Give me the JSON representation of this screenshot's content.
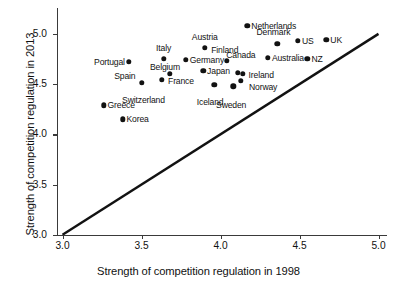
{
  "chart_data": {
    "type": "scatter",
    "title": "",
    "xlabel": "Strength of competition regulation in 1998",
    "ylabel": "Strength of competition regulation in 2013",
    "xlim": [
      3.0,
      5.0
    ],
    "ylim": [
      3.0,
      5.15
    ],
    "xticks": [
      "3.0",
      "3.5",
      "4.0",
      "4.5",
      "5.0"
    ],
    "xtick_values": [
      3.0,
      3.5,
      4.0,
      4.5,
      5.0
    ],
    "yticks": [
      "3.0",
      "3.5",
      "4.0",
      "4.5",
      "5.0"
    ],
    "ytick_values": [
      3.0,
      3.5,
      4.0,
      4.5,
      5.0
    ],
    "grid": false,
    "legend": "none",
    "reference_line": {
      "name": "45-degree-line",
      "from": [
        3.0,
        3.0
      ],
      "to": [
        5.0,
        5.0
      ],
      "color": "#121212"
    },
    "point_color": "#121212",
    "points": [
      {
        "label": "Netherlands",
        "x": 4.17,
        "y": 5.08,
        "lpos": "r"
      },
      {
        "label": "UK",
        "x": 4.67,
        "y": 4.94,
        "lpos": "r"
      },
      {
        "label": "US",
        "x": 4.49,
        "y": 4.93,
        "lpos": "r"
      },
      {
        "label": "Denmark",
        "x": 4.36,
        "y": 4.9,
        "lpos": "t"
      },
      {
        "label": "Austria",
        "x": 3.9,
        "y": 4.86,
        "lpos": "t"
      },
      {
        "label": "Australia",
        "x": 4.3,
        "y": 4.76,
        "lpos": "r"
      },
      {
        "label": "Italy",
        "x": 3.64,
        "y": 4.75,
        "lpos": "t"
      },
      {
        "label": "NZ",
        "x": 4.55,
        "y": 4.75,
        "lpos": "r"
      },
      {
        "label": "Germany",
        "x": 3.78,
        "y": 4.74,
        "lpos": "r"
      },
      {
        "label": "Finland",
        "x": 4.04,
        "y": 4.73,
        "lpos": "t"
      },
      {
        "label": "Portugal",
        "x": 3.42,
        "y": 4.72,
        "lpos": "l"
      },
      {
        "label": "Japan",
        "x": 3.89,
        "y": 4.63,
        "lpos": "r"
      },
      {
        "label": "Canada",
        "x": 4.11,
        "y": 4.61,
        "lpos": "t"
      },
      {
        "label": "Belgium",
        "x": 3.68,
        "y": 4.6,
        "lpos": "l"
      },
      {
        "label": "Ireland",
        "x": 4.14,
        "y": 4.6,
        "lpos": "r"
      },
      {
        "label": "France",
        "x": 3.63,
        "y": 4.54,
        "lpos": "r"
      },
      {
        "label": "Norway",
        "x": 4.13,
        "y": 4.53,
        "lpos": "r"
      },
      {
        "label": "Spain",
        "x": 3.5,
        "y": 4.51,
        "lpos": "l"
      },
      {
        "label": "Switzerland",
        "x": 3.5,
        "y": 4.51,
        "lpos": "b"
      },
      {
        "label": "Iceland",
        "x": 3.96,
        "y": 4.49,
        "lpos": "b"
      },
      {
        "label": "Sweden",
        "x": 4.08,
        "y": 4.48,
        "lpos": "b"
      },
      {
        "label": "Greece",
        "x": 3.26,
        "y": 4.29,
        "lpos": "r"
      },
      {
        "label": "Korea",
        "x": 3.38,
        "y": 4.15,
        "lpos": "r"
      }
    ]
  }
}
